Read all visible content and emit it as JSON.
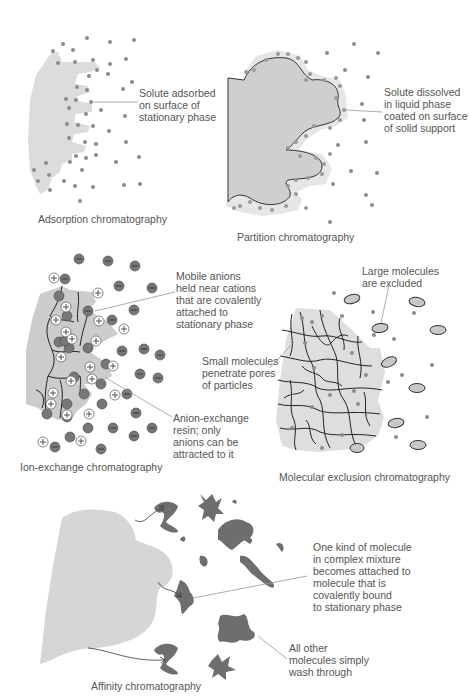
{
  "colors": {
    "stationary_phase": "#d9d9d9",
    "liquid_coat": "#e4e4e4",
    "solute_dot": "#8c8c8c",
    "anion": "#777777",
    "cation_fill": "#ffffff",
    "molecule_dark": "#6e6e6e",
    "large_molecule": "#c8c8c8",
    "text": "#555555",
    "leader_line": "#999999"
  },
  "panels": {
    "adsorption": {
      "caption": "Adsorption chromatography",
      "label": "Solute adsorbed\non surface of\nstationary phase"
    },
    "partition": {
      "caption": "Partition chromatography",
      "label": "Solute dissolved\nin liquid phase\ncoated on surface\nof solid support"
    },
    "ion_exchange": {
      "caption": "Ion-exchange chromatography",
      "label_top": "Mobile anions\nheld near cations\nthat are covalently\nattached to\nstationary phase",
      "label_bottom": "Anion-exchange\nresin; only\nanions can be\nattracted to it",
      "cation_symbol": "+",
      "anion_symbol": "−"
    },
    "molecular_exclusion": {
      "caption": "Molecular exclusion chromatography",
      "label_top": "Large molecules\nare excluded",
      "label_left": "Small molecules\npenetrate pores\nof particles"
    },
    "affinity": {
      "caption": "Affinity chromatography",
      "label_top": "One kind of molecule\nin complex mixture\nbecomes attached to\nmolecule that is\ncovalently bound\nto stationary phase",
      "label_bottom": "All other\nmolecules simply\nwash through"
    }
  }
}
